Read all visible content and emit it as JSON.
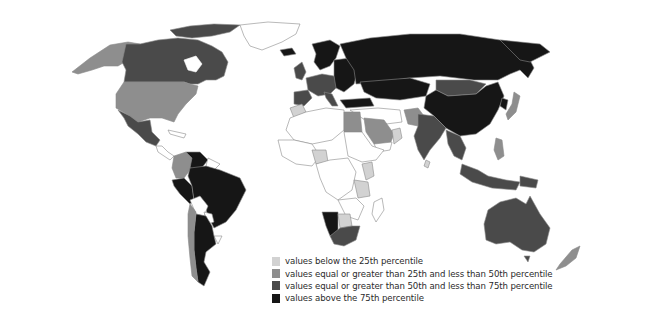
{
  "map": {
    "type": "choropleth",
    "projection": "Robinson-like world",
    "palette": {
      "no_data": "#ffffff",
      "q1": "#d2d2d2",
      "q2": "#8e8e8e",
      "q3": "#4a4a4a",
      "q4": "#161616"
    },
    "regions": [
      {
        "name": "Alaska (USA)",
        "class": "q2"
      },
      {
        "name": "Canada",
        "class": "q3"
      },
      {
        "name": "Canadian Arctic",
        "class": "q3"
      },
      {
        "name": "Greenland",
        "class": "no_data"
      },
      {
        "name": "United States",
        "class": "q2"
      },
      {
        "name": "Mexico",
        "class": "q3"
      },
      {
        "name": "Central America",
        "class": "no_data"
      },
      {
        "name": "Colombia",
        "class": "q2"
      },
      {
        "name": "Venezuela",
        "class": "q4"
      },
      {
        "name": "Brazil",
        "class": "q4"
      },
      {
        "name": "Peru",
        "class": "q4"
      },
      {
        "name": "Bolivia",
        "class": "no_data"
      },
      {
        "name": "Paraguay",
        "class": "no_data"
      },
      {
        "name": "Chile",
        "class": "q2"
      },
      {
        "name": "Argentina",
        "class": "q4"
      },
      {
        "name": "Uruguay",
        "class": "no_data"
      },
      {
        "name": "Iceland",
        "class": "q4"
      },
      {
        "name": "United Kingdom",
        "class": "q3"
      },
      {
        "name": "Western Europe",
        "class": "q3"
      },
      {
        "name": "Spain",
        "class": "q3"
      },
      {
        "name": "Scandinavia",
        "class": "q4"
      },
      {
        "name": "Eastern Europe",
        "class": "q4"
      },
      {
        "name": "Turkey",
        "class": "q4"
      },
      {
        "name": "Russia",
        "class": "q4"
      },
      {
        "name": "Kazakhstan / Central Asia",
        "class": "q4"
      },
      {
        "name": "Mongolia",
        "class": "q3"
      },
      {
        "name": "China",
        "class": "q4"
      },
      {
        "name": "Japan",
        "class": "q2"
      },
      {
        "name": "Korea",
        "class": "q4"
      },
      {
        "name": "Morocco",
        "class": "q1"
      },
      {
        "name": "North Africa",
        "class": "no_data"
      },
      {
        "name": "Egypt",
        "class": "q2"
      },
      {
        "name": "Saudi Arabia",
        "class": "q2"
      },
      {
        "name": "Oman",
        "class": "q1"
      },
      {
        "name": "Pakistan",
        "class": "q2"
      },
      {
        "name": "India",
        "class": "q3"
      },
      {
        "name": "Sri Lanka",
        "class": "q1"
      },
      {
        "name": "Southeast Asia",
        "class": "q3"
      },
      {
        "name": "Indonesia",
        "class": "q3"
      },
      {
        "name": "Philippines",
        "class": "q2"
      },
      {
        "name": "Nigeria",
        "class": "q1"
      },
      {
        "name": "Kenya",
        "class": "q1"
      },
      {
        "name": "Tanzania",
        "class": "q1"
      },
      {
        "name": "Central Africa",
        "class": "no_data"
      },
      {
        "name": "Namibia",
        "class": "q4"
      },
      {
        "name": "Botswana",
        "class": "q1"
      },
      {
        "name": "South Africa",
        "class": "q3"
      },
      {
        "name": "Madagascar",
        "class": "no_data"
      },
      {
        "name": "Australia",
        "class": "q3"
      },
      {
        "name": "New Zealand",
        "class": "q2"
      }
    ]
  },
  "legend": {
    "items": [
      {
        "label": "values below the 25th percentile",
        "color": "#d2d2d2"
      },
      {
        "label": "values equal or greater than 25th and less than 50th percentile",
        "color": "#8e8e8e"
      },
      {
        "label": "values equal or greater than 50th and less than 75th percentile",
        "color": "#4a4a4a"
      },
      {
        "label": "values above the 75th percentile",
        "color": "#161616"
      }
    ]
  }
}
